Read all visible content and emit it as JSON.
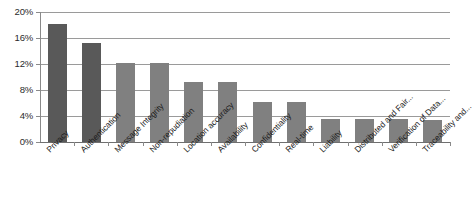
{
  "chart_data": {
    "type": "bar",
    "title": "",
    "subtitle": "",
    "xlabel": "",
    "ylabel": "",
    "ylim": [
      0,
      20
    ],
    "yticks": [
      "0%",
      "4%",
      "8%",
      "12%",
      "16%",
      "20%"
    ],
    "ytick_values": [
      0,
      4,
      8,
      12,
      16,
      20
    ],
    "grid": true,
    "legend": "none",
    "value_suffix": "%",
    "categories": [
      "Privacy",
      "Authentication",
      "Message Integrity",
      "Non-repudiation",
      "Location accuracy",
      "Availability",
      "Confidentiality",
      "Real-time",
      "Liability",
      "Distributed and Fair...",
      "Verification of Data...",
      "Traceability and..."
    ],
    "values": [
      18.2,
      15.2,
      12.1,
      12.1,
      9.3,
      9.3,
      6.2,
      6.2,
      3.6,
      3.6,
      3.6,
      3.4
    ],
    "bar_colors": [
      "#595959",
      "#595959",
      "#808080",
      "#808080",
      "#808080",
      "#808080",
      "#808080",
      "#808080",
      "#808080",
      "#808080",
      "#808080",
      "#808080"
    ]
  },
  "colors": {
    "dark_bar": "#595959",
    "light_bar": "#808080",
    "gridline": "#9a9a9a",
    "axis": "#8a8a8a",
    "text": "#1c1c1c",
    "background": "#ffffff"
  }
}
